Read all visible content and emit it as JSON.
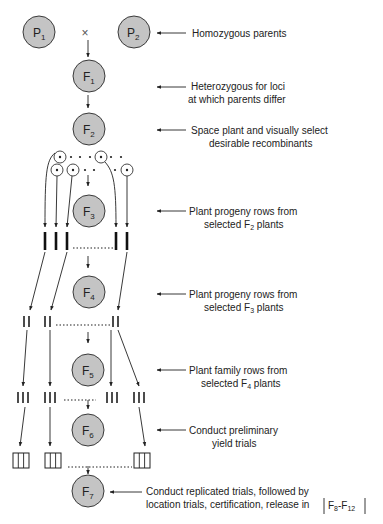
{
  "diagram": {
    "type": "pedigree-breeding-method",
    "cross_symbol": "×",
    "nodes": [
      {
        "id": "P1",
        "base": "P",
        "sub": "1"
      },
      {
        "id": "P2",
        "base": "P",
        "sub": "2"
      },
      {
        "id": "F1",
        "base": "F",
        "sub": "1"
      },
      {
        "id": "F2",
        "base": "F",
        "sub": "2"
      },
      {
        "id": "F3",
        "base": "F",
        "sub": "3"
      },
      {
        "id": "F4",
        "base": "F",
        "sub": "4"
      },
      {
        "id": "F5",
        "base": "F",
        "sub": "5"
      },
      {
        "id": "F6",
        "base": "F",
        "sub": "6"
      },
      {
        "id": "F7",
        "base": "F",
        "sub": "7"
      }
    ],
    "annotations": [
      {
        "target": "P2",
        "lines": [
          {
            "text": "Homozygous parents"
          }
        ]
      },
      {
        "target": "F1",
        "lines": [
          {
            "text": "Heterozygous for loci"
          },
          {
            "text": "at which parents differ"
          }
        ]
      },
      {
        "target": "F2",
        "lines": [
          {
            "text": "Space plant and visually select"
          },
          {
            "text": "desirable recombinants"
          }
        ]
      },
      {
        "target": "F3",
        "lines": [
          {
            "text": "Plant progeny rows from"
          },
          {
            "pre": "selected F",
            "sub": "2",
            "post": " plants"
          }
        ]
      },
      {
        "target": "F4",
        "lines": [
          {
            "text": "Plant progeny rows from"
          },
          {
            "pre": "selected F",
            "sub": "3",
            "post": " plants"
          }
        ]
      },
      {
        "target": "F5",
        "lines": [
          {
            "text": "Plant family rows from"
          },
          {
            "pre": "selected F",
            "sub": "4",
            "post": " plants"
          }
        ]
      },
      {
        "target": "F6",
        "lines": [
          {
            "text": "Conduct preliminary"
          },
          {
            "text": "yield trials"
          }
        ]
      },
      {
        "target": "F7",
        "lines": [
          {
            "text": "Conduct replicated trials, followed by"
          },
          {
            "text": "location trials, certification, release in"
          }
        ]
      }
    ],
    "release_box": {
      "pre": "F",
      "sub1": "8",
      "mid": "-F",
      "sub2": "12"
    },
    "colors": {
      "node_fill": "#c4c4c4",
      "node_stroke": "#3a3a3a",
      "ink": "#222222",
      "background": "#ffffff"
    }
  }
}
